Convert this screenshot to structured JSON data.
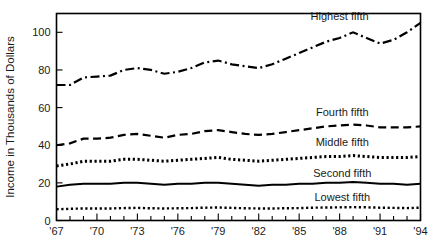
{
  "chart_data": {
    "type": "line",
    "title": "",
    "subtitle": "",
    "xlabel": "",
    "ylabel": "Income in Thousands of Dollars",
    "xlim": [
      1967,
      1994
    ],
    "ylim": [
      0,
      110
    ],
    "yticks": [
      0,
      20,
      40,
      60,
      80,
      100
    ],
    "ytick_labels": [
      "0",
      "20",
      "40",
      "60",
      "80",
      "100"
    ],
    "xticks": [
      1967,
      1968,
      1969,
      1970,
      1971,
      1972,
      1973,
      1974,
      1975,
      1976,
      1977,
      1978,
      1979,
      1980,
      1981,
      1982,
      1983,
      1984,
      1985,
      1986,
      1987,
      1988,
      1989,
      1990,
      1991,
      1992,
      1993,
      1994
    ],
    "xtick_labels": [
      "'67",
      "",
      "",
      "'70",
      "",
      "",
      "'73",
      "",
      "",
      "'76",
      "",
      "",
      "'79",
      "",
      "",
      "'82",
      "",
      "",
      "'85",
      "",
      "",
      "'88",
      "",
      "",
      "'91",
      "",
      "",
      "'94"
    ],
    "grid": false,
    "legend_position": "inline-right-above-each-series",
    "x": [
      1967,
      1968,
      1969,
      1970,
      1971,
      1972,
      1973,
      1974,
      1975,
      1976,
      1977,
      1978,
      1979,
      1980,
      1981,
      1982,
      1983,
      1984,
      1985,
      1986,
      1987,
      1988,
      1989,
      1990,
      1991,
      1992,
      1993,
      1994
    ],
    "series": [
      {
        "name": "Highest fifth",
        "label": "Highest fifth",
        "style": "dash-dot",
        "dasharray": "9,3.5,2,3.5",
        "width": 2.2,
        "color": "#000000",
        "label_x": 1988.0,
        "label_y": 108.5,
        "values": [
          72,
          72,
          76,
          76.5,
          77,
          80,
          81,
          80,
          78,
          79,
          81,
          84,
          85,
          83,
          82,
          81,
          83,
          86,
          89,
          92,
          95,
          97,
          100,
          97,
          94,
          96,
          100,
          105
        ]
      },
      {
        "name": "Fourth fifth",
        "label": "Fourth fifth",
        "style": "dashed",
        "dasharray": "8,4.5",
        "width": 2.2,
        "color": "#000000",
        "label_x": 1988.2,
        "label_y": 57.5,
        "values": [
          40,
          41,
          43.5,
          43.5,
          44,
          45.5,
          46,
          45,
          44,
          45.5,
          46,
          47.5,
          48,
          47,
          46,
          45.5,
          46,
          47,
          48,
          49,
          50,
          50.5,
          51,
          50.5,
          49.5,
          49.5,
          49.5,
          50
        ]
      },
      {
        "name": "Middle fifth",
        "label": "Middle fifth",
        "style": "dotted-thick",
        "dasharray": "2.2,2.6",
        "width": 3.0,
        "color": "#000000",
        "label_x": 1988.2,
        "label_y": 41.5,
        "values": [
          29,
          30,
          31.5,
          31.5,
          31.5,
          32.5,
          32.5,
          32,
          31.5,
          32,
          32.5,
          33,
          33.5,
          32.5,
          32,
          31.5,
          32,
          32.5,
          33,
          33.5,
          34,
          34,
          34.5,
          34,
          33.5,
          33.5,
          33.5,
          34
        ]
      },
      {
        "name": "Second fifth",
        "label": "Second fifth",
        "style": "solid",
        "dasharray": "",
        "width": 2.0,
        "color": "#000000",
        "label_x": 1988.2,
        "label_y": 25.5,
        "values": [
          18,
          19,
          19.5,
          19.5,
          19.5,
          20,
          20,
          19.5,
          19,
          19.5,
          19.5,
          20,
          20,
          19.5,
          19,
          18.5,
          19,
          19,
          19.5,
          19.5,
          20,
          20,
          20.5,
          20,
          19.5,
          19.5,
          19,
          19.5
        ]
      },
      {
        "name": "Lowest fifth",
        "label": "Lowest fifth",
        "style": "dotted-fine",
        "dasharray": "2.2,2.6",
        "width": 2.4,
        "color": "#000000",
        "label_x": 1988.2,
        "label_y": 12.5,
        "values": [
          6,
          6.2,
          6.4,
          6.4,
          6.4,
          6.6,
          6.7,
          6.5,
          6.4,
          6.5,
          6.6,
          6.8,
          6.9,
          6.7,
          6.5,
          6.4,
          6.4,
          6.5,
          6.6,
          6.8,
          6.9,
          7.0,
          7.1,
          7.0,
          6.8,
          6.7,
          6.6,
          6.8
        ]
      }
    ]
  }
}
